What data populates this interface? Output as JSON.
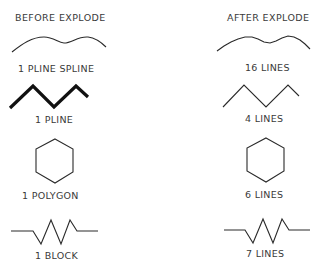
{
  "headers": {
    "before": "BEFORE EXPLODE",
    "after": "AFTER EXPLODE"
  },
  "rows": [
    {
      "shape": "spline-curve-icon",
      "before_label": "1 PLINE SPLINE",
      "after_label": "16 LINES"
    },
    {
      "shape": "zigzag-polyline-icon",
      "before_label": "1 PLINE",
      "after_label": "4 LINES"
    },
    {
      "shape": "hexagon-icon",
      "before_label": "1 POLYGON",
      "after_label": "6 LINES"
    },
    {
      "shape": "resistor-symbol-icon",
      "before_label": "1 BLOCK",
      "after_label": "7 LINES"
    }
  ],
  "colors": {
    "line": "#2a2a2a",
    "thick_line": "#111111",
    "text": "#3a3a3a",
    "background": "#ffffff"
  }
}
